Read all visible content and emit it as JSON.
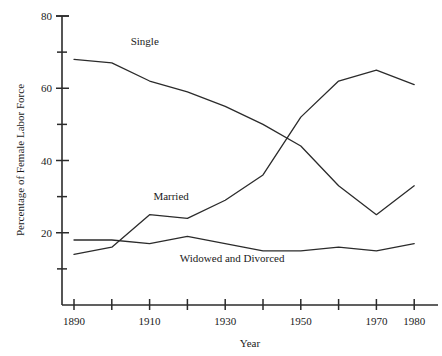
{
  "chart_data": {
    "type": "line",
    "title": "",
    "xlabel": "Year",
    "ylabel": "Percentage of Female Labor Force",
    "xlim": [
      1885,
      1988
    ],
    "ylim": [
      0,
      80
    ],
    "grid": false,
    "legend": "inline-labels",
    "x": [
      1890,
      1900,
      1910,
      1920,
      1930,
      1940,
      1950,
      1960,
      1970,
      1980
    ],
    "x_major_ticks": [
      1890,
      1910,
      1930,
      1950,
      1970,
      1980
    ],
    "x_tick_labels": [
      "1890",
      "1910",
      "1930",
      "1950",
      "1970",
      "1980"
    ],
    "x_all_ticks": [
      1890,
      1900,
      1910,
      1920,
      1930,
      1940,
      1950,
      1960,
      1970,
      1980
    ],
    "y_major_ticks": [
      20,
      40,
      60,
      80
    ],
    "y_tick_labels": [
      "20",
      "40",
      "60",
      "80"
    ],
    "y_minor_ticks": [
      10,
      30,
      50,
      70
    ],
    "series": [
      {
        "name": "Single",
        "label": "Single",
        "label_x": 1905,
        "label_y": 72,
        "values": [
          68,
          67,
          62,
          59,
          55,
          50,
          44,
          33,
          25,
          33
        ]
      },
      {
        "name": "Married",
        "label": "Married",
        "label_x": 1911,
        "label_y": 29,
        "values": [
          14,
          16,
          25,
          24,
          29,
          36,
          52,
          62,
          65,
          61
        ]
      },
      {
        "name": "Widowed and Divorced",
        "label": "Widowed and Divorced",
        "label_x": 1918,
        "label_y": 12,
        "values": [
          18,
          18,
          17,
          19,
          17,
          15,
          15,
          16,
          15,
          17
        ]
      }
    ]
  },
  "axes": {
    "x_axis_title": "Year",
    "y_axis_title": "Percentage of Female Labor Force"
  }
}
